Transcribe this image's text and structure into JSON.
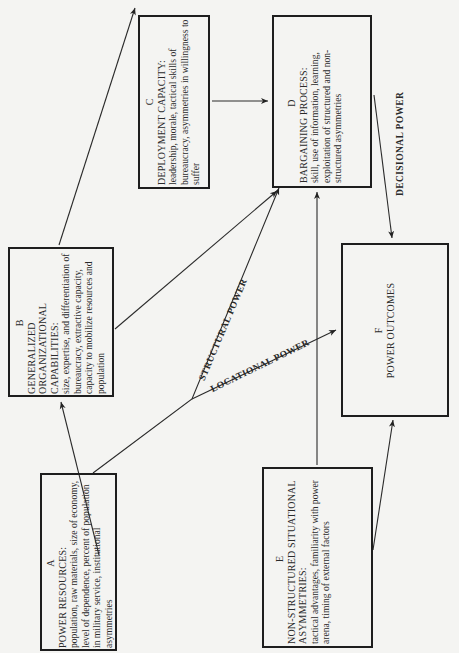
{
  "diagram": {
    "nodes": [
      {
        "id": "A",
        "letter": "A",
        "title": "POWER RESOURCES:",
        "description": "population, raw materials, size of economy, level of dependence, percent of population in military service, institutional asymmetries"
      },
      {
        "id": "B",
        "letter": "B",
        "title": "GENERALIZED ORGANIZATIONAL CAPABILITIES:",
        "description": "size, expertise, and differentiation of bureaucracy, extractive capacity, capacity to mobilize resources and population"
      },
      {
        "id": "C",
        "letter": "C",
        "title": "DEPLOYMENT CAPACITY:",
        "description": "leadership, morale, tactical skills of bureaucracy, asymmetries in willingness to suffer"
      },
      {
        "id": "D",
        "letter": "D",
        "title": "BARGAINING PROCESS:",
        "description": "skill, use of information, learning, exploitation of structured and non-structured asymmetries"
      },
      {
        "id": "E",
        "letter": "E",
        "title": "NON-STRUCTURED SITUATIONAL ASYMMETRIES:",
        "description": "tactical advantages, familiarity with power arena, timing of external factors"
      },
      {
        "id": "F",
        "letter": "F",
        "title": "POWER OUTCOMES",
        "description": ""
      }
    ],
    "edges": [
      {
        "from": "A",
        "to": "B",
        "label": ""
      },
      {
        "from": "A",
        "to": "D",
        "label": "STRUCTURAL POWER"
      },
      {
        "from": "A",
        "to": "F",
        "label": "LOCATIONAL POWER"
      },
      {
        "from": "B",
        "to": "C",
        "label": ""
      },
      {
        "from": "B",
        "to": "D",
        "label": ""
      },
      {
        "from": "C",
        "to": "D",
        "label": ""
      },
      {
        "from": "D",
        "to": "F",
        "label": "DECISIONAL POWER"
      },
      {
        "from": "E",
        "to": "D",
        "label": ""
      },
      {
        "from": "E",
        "to": "F",
        "label": ""
      }
    ],
    "labels": {
      "structural": "STRUCTURAL POWER",
      "locational": "LOCATIONAL POWER",
      "decisional": "DECISIONAL POWER"
    }
  }
}
